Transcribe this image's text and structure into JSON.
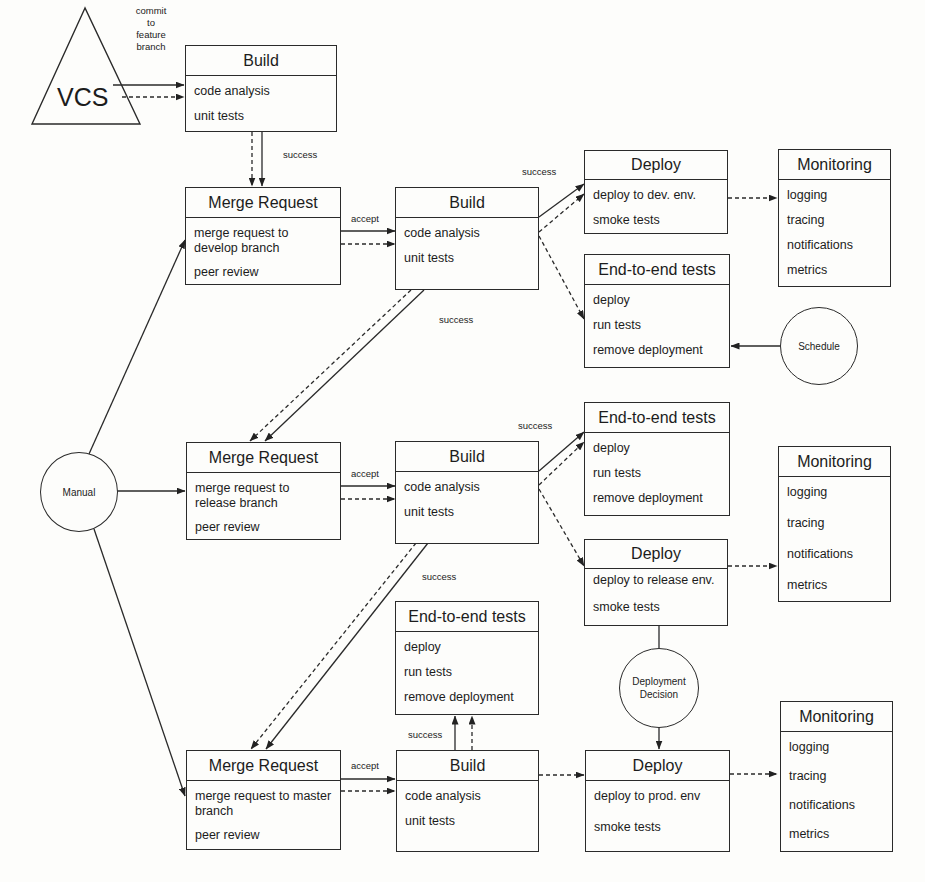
{
  "diagram": {
    "type": "CI/CD pipeline flow",
    "source": {
      "label": "VCS",
      "edge_label": "commit to feature branch",
      "edge_label_lines": [
        "commit",
        "to",
        "feature",
        "branch"
      ]
    },
    "triggers": {
      "manual": "Manual",
      "schedule": "Schedule",
      "deployment_decision_lines": [
        "Deployment",
        "Decision"
      ]
    },
    "edge_labels": {
      "success": "success",
      "accept": "accept"
    },
    "stages": {
      "feature_build": {
        "title": "Build",
        "items": [
          "code analysis",
          "unit tests"
        ]
      },
      "develop": {
        "merge_request": {
          "title": "Merge Request",
          "items": [
            "merge request to develop branch",
            "peer review"
          ],
          "item_lines": [
            [
              "merge request to",
              "develop branch"
            ],
            [
              "peer review"
            ]
          ]
        },
        "build": {
          "title": "Build",
          "items": [
            "code analysis",
            "unit tests"
          ]
        },
        "deploy": {
          "title": "Deploy",
          "items": [
            "deploy to dev. env.",
            "smoke tests"
          ]
        },
        "e2e": {
          "title": "End-to-end tests",
          "items": [
            "deploy",
            "run tests",
            "remove deployment"
          ]
        },
        "monitoring": {
          "title": "Monitoring",
          "items": [
            "logging",
            "tracing",
            "notifications",
            "metrics"
          ]
        }
      },
      "release": {
        "merge_request": {
          "title": "Merge Request",
          "items": [
            "merge request to release branch",
            "peer review"
          ],
          "item_lines": [
            [
              "merge request to",
              "release branch"
            ],
            [
              "peer review"
            ]
          ]
        },
        "build": {
          "title": "Build",
          "items": [
            "code analysis",
            "unit tests"
          ]
        },
        "e2e": {
          "title": "End-to-end tests",
          "items": [
            "deploy",
            "run tests",
            "remove deployment"
          ]
        },
        "deploy": {
          "title": "Deploy",
          "items": [
            "deploy to release env.",
            "smoke tests"
          ]
        },
        "monitoring": {
          "title": "Monitoring",
          "items": [
            "logging",
            "tracing",
            "notifications",
            "metrics"
          ]
        }
      },
      "master": {
        "merge_request": {
          "title": "Merge Request",
          "items": [
            "merge request to master branch",
            "peer review"
          ],
          "item_lines": [
            [
              "merge request to master",
              "branch"
            ],
            [
              "peer review"
            ]
          ]
        },
        "build": {
          "title": "Build",
          "items": [
            "code analysis",
            "unit tests"
          ]
        },
        "e2e": {
          "title": "End-to-end tests",
          "items": [
            "deploy",
            "run tests",
            "remove deployment"
          ]
        },
        "deploy": {
          "title": "Deploy",
          "items": [
            "deploy to prod. env",
            "smoke tests"
          ]
        },
        "monitoring": {
          "title": "Monitoring",
          "items": [
            "logging",
            "tracing",
            "notifications",
            "metrics"
          ]
        }
      }
    },
    "colors": {
      "stroke": "#2a2a2a",
      "background": "#fdfdfb",
      "text": "#1c1c1c"
    }
  }
}
